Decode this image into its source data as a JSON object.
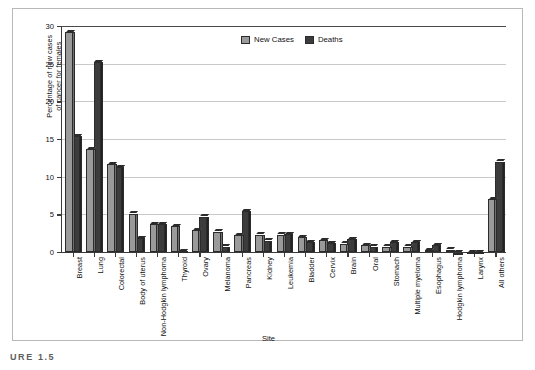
{
  "chart_data": {
    "type": "bar",
    "title": "",
    "xlabel": "Site",
    "ylabel": "Percentage of new cases\nof cancer for females",
    "ylim": [
      0,
      30
    ],
    "ytick_values": [
      0,
      5,
      10,
      15,
      20,
      25,
      30
    ],
    "ytick_labels": [
      "0",
      "5",
      "10",
      "15",
      "20",
      "25",
      "30"
    ],
    "grid": true,
    "legend_position": "top-center",
    "categories": [
      "Breast",
      "Lung",
      "Colorectal",
      "Body of uterus",
      "Non-Hodgkin lymphoma",
      "Thyroid",
      "Ovary",
      "Melanoma",
      "Pancreas",
      "Kidney",
      "Leukemia",
      "Bladder",
      "Cervix",
      "Brain",
      "Oral",
      "Stomach",
      "Multiple myeloma",
      "Esophagus",
      "Hodgkin lymphoma",
      "Larynx",
      "All others"
    ],
    "series": [
      {
        "name": "New Cases",
        "color": "#9a9a9a",
        "values": [
          29.5,
          14.0,
          12.0,
          5.4,
          4.0,
          3.7,
          3.2,
          3.0,
          2.5,
          2.6,
          2.6,
          2.3,
          1.9,
          1.4,
          1.2,
          1.0,
          1.0,
          0.5,
          0.6,
          0.3,
          7.3
        ]
      },
      {
        "name": "Deaths",
        "color": "#3c3c3c",
        "values": [
          15.7,
          25.5,
          11.6,
          2.1,
          4.0,
          0.4,
          5.0,
          1.0,
          5.7,
          1.8,
          2.7,
          1.6,
          1.5,
          2.0,
          1.0,
          1.6,
          1.6,
          1.2,
          0.2,
          0.3,
          12.3
        ]
      }
    ]
  },
  "legend": {
    "items": [
      {
        "label": "New Cases",
        "key": "new-cases"
      },
      {
        "label": "Deaths",
        "key": "deaths"
      }
    ]
  },
  "caption": {
    "text": "URE 1.5"
  }
}
